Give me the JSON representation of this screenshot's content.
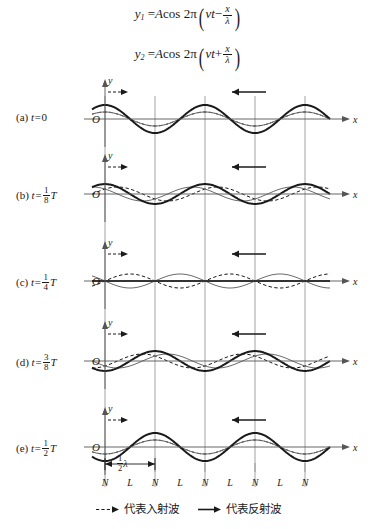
{
  "equations": {
    "line1": {
      "lhs": "y",
      "lhs_sub": "1",
      "eq": "=",
      "amp": "A",
      "fn": "cos",
      "coef": "2π",
      "term1": "νt",
      "op": "−",
      "frac_num": "x",
      "frac_den": "λ"
    },
    "line2": {
      "lhs": "y",
      "lhs_sub": "2",
      "eq": "=",
      "amp": "A",
      "fn": "cos",
      "coef": "2π",
      "term1": "νt",
      "op": "+",
      "frac_num": "x",
      "frac_den": "λ"
    }
  },
  "panels": [
    {
      "tag": "(a)",
      "t_prefix": "t=",
      "t_value": "0",
      "t_num": "",
      "t_den": "",
      "t_suffix": "",
      "phase_frac": 0.0,
      "y_axis": "y",
      "x_axis": "x",
      "origin": "O"
    },
    {
      "tag": "(b)",
      "t_prefix": "t=",
      "t_value": "",
      "t_num": "1",
      "t_den": "8",
      "t_suffix": "T",
      "phase_frac": 0.125,
      "y_axis": "y",
      "x_axis": "x",
      "origin": "O"
    },
    {
      "tag": "(c)",
      "t_prefix": "t=",
      "t_value": "",
      "t_num": "1",
      "t_den": "4",
      "t_suffix": "T",
      "phase_frac": 0.25,
      "y_axis": "y",
      "x_axis": "x",
      "origin": "O"
    },
    {
      "tag": "(d)",
      "t_prefix": "t=",
      "t_value": "",
      "t_num": "3",
      "t_den": "8",
      "t_suffix": "T",
      "phase_frac": 0.375,
      "y_axis": "y",
      "x_axis": "x",
      "origin": "O"
    },
    {
      "tag": "(e)",
      "t_prefix": "t=",
      "t_value": "",
      "t_num": "1",
      "t_den": "2",
      "t_suffix": "T",
      "phase_frac": 0.5,
      "y_axis": "y",
      "x_axis": "x",
      "origin": "O"
    }
  ],
  "node_loop_labels": [
    "N",
    "L",
    "N",
    "L",
    "N",
    "L",
    "N",
    "L",
    "N"
  ],
  "half_wavelength": {
    "num": "1",
    "den": "2",
    "symbol": "λ"
  },
  "legend": {
    "incident_text": "代表入射波",
    "reflected_text": "代表反射波"
  },
  "arrows": {
    "incident_label": "incident-direction-arrow",
    "reflected_label": "reflected-direction-arrow"
  },
  "chart_data": {
    "type": "line",
    "xlabel": "x",
    "ylabel": "y",
    "grid": true,
    "legend_position": "bottom",
    "x_range_wavelengths": [
      -0.13,
      2.35
    ],
    "amplitude_component": 7,
    "amplitude_resultant": 14,
    "half_wavelength_px": 50,
    "wavelength_px": 100,
    "node_positions_px": [
      105,
      155,
      205,
      255,
      305
    ],
    "loop_positions_px": [
      130,
      180,
      230,
      280
    ],
    "series": [
      {
        "name": "incident wave (y1)",
        "style": "dashed",
        "direction": "right",
        "formula": "A cos 2π(νt - x/λ)"
      },
      {
        "name": "reflected wave (y2)",
        "style": "thin-solid",
        "direction": "left",
        "formula": "A cos 2π(νt + x/λ)"
      },
      {
        "name": "resultant standing wave",
        "style": "thick-solid",
        "direction": "stationary",
        "formula": "2A cos(2πνt) cos(2πx/λ)"
      }
    ],
    "panel_phases": [
      0.0,
      0.125,
      0.25,
      0.375,
      0.5
    ],
    "panel_resultant_amplitude_factor": [
      1.0,
      0.7071,
      0.0,
      -0.7071,
      -1.0
    ]
  },
  "colors": {
    "ink": "#1a1a1a",
    "grid": "#8c8c8c",
    "axis": "#555555",
    "component": "#6b6b6b"
  }
}
